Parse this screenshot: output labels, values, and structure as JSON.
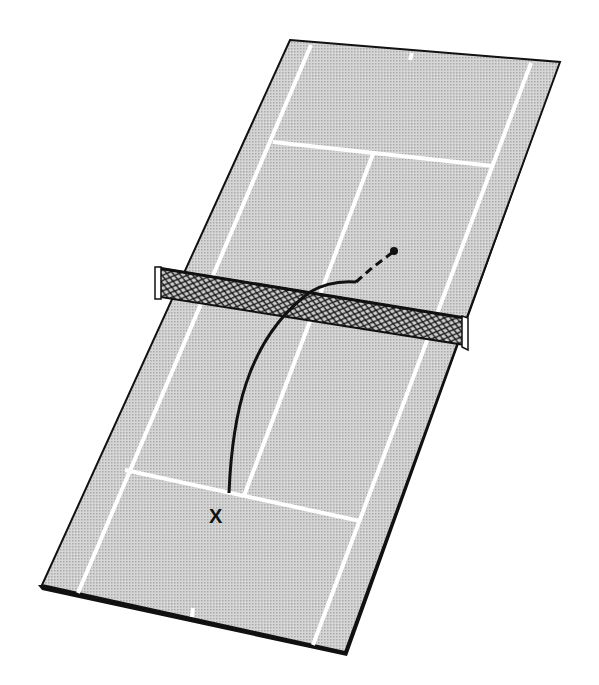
{
  "diagram": {
    "type": "tennis-court-shot-diagram",
    "colors": {
      "court_fill": "#c8c8c8",
      "court_lines": "#ffffff",
      "outline": "#111111",
      "net_mesh": "#222222",
      "shot_path": "#111111",
      "background": "#ffffff"
    },
    "labels": {
      "player_position": "X"
    },
    "elements": {
      "court": "tennis-court",
      "net": "tennis-net",
      "shot_path_solid": "ball-trajectory",
      "shot_path_dashed": "ball-trajectory-after-bounce",
      "landing_point": "ball-landing-dot"
    }
  }
}
